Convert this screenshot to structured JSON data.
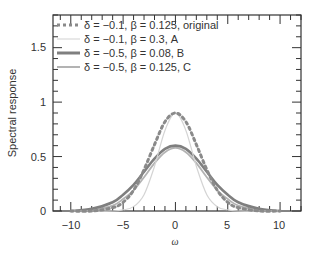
{
  "chart_data": {
    "type": "line",
    "title": "",
    "xlabel": "ω",
    "ylabel": "Spectral response",
    "xlim": [
      -11.7,
      12
    ],
    "ylim": [
      0,
      1.8
    ],
    "xticks": [
      -10,
      -5,
      0,
      5,
      10
    ],
    "xtick_labels": [
      "−10",
      "−5",
      "0",
      "5",
      "10"
    ],
    "yticks": [
      0,
      0.5,
      1,
      1.5
    ],
    "ytick_labels": [
      "0",
      "0.5",
      "1",
      "1.5"
    ],
    "grid": false,
    "legend_position": "upper left",
    "x": [
      -10,
      -8,
      -6,
      -5,
      -4,
      -3,
      -2,
      -1,
      0,
      1,
      2,
      3,
      4,
      5,
      6,
      8,
      10
    ],
    "series": [
      {
        "name": "δ = −0.1, β = 0.125, original",
        "style": "dotted",
        "color": "#8a8a8a",
        "values": [
          0.0,
          0.0,
          0.03,
          0.08,
          0.19,
          0.38,
          0.61,
          0.82,
          0.9,
          0.82,
          0.61,
          0.38,
          0.19,
          0.08,
          0.03,
          0.0,
          0.0
        ]
      },
      {
        "name": "δ = −0.1, β = 0.3, A",
        "style": "solid-thin",
        "color": "#d4d4d4",
        "values": [
          0.0,
          0.0,
          0.0,
          0.01,
          0.04,
          0.15,
          0.41,
          0.74,
          0.9,
          0.74,
          0.41,
          0.15,
          0.04,
          0.01,
          0.0,
          0.0,
          0.0
        ]
      },
      {
        "name": "δ = −0.5, β = 0.08, B",
        "style": "solid-thick",
        "color": "#7f7f7f",
        "values": [
          0.0,
          0.02,
          0.08,
          0.15,
          0.24,
          0.36,
          0.48,
          0.57,
          0.6,
          0.57,
          0.48,
          0.36,
          0.24,
          0.15,
          0.08,
          0.02,
          0.0
        ]
      },
      {
        "name": "δ = −0.5, β = 0.125, C",
        "style": "solid",
        "color": "#b3b3b3",
        "values": [
          0.0,
          0.01,
          0.05,
          0.11,
          0.19,
          0.31,
          0.44,
          0.54,
          0.58,
          0.54,
          0.44,
          0.31,
          0.19,
          0.11,
          0.05,
          0.01,
          0.0
        ]
      }
    ]
  },
  "legend": {
    "items": [
      {
        "label": "δ = −0.1, β = 0.125, original"
      },
      {
        "label": "δ = −0.1, β = 0.3, A"
      },
      {
        "label": "δ = −0.5, β = 0.08, B"
      },
      {
        "label": "δ = −0.5, β = 0.125, C"
      }
    ]
  },
  "axes": {
    "xlabel": "ω",
    "ylabel": "Spectral response",
    "yticks": [
      {
        "label": "1.5"
      },
      {
        "label": "1"
      },
      {
        "label": "0.5"
      },
      {
        "label": "0"
      }
    ],
    "xticks": [
      {
        "label": "−10"
      },
      {
        "label": "−5"
      },
      {
        "label": "0"
      },
      {
        "label": "5"
      },
      {
        "label": "10"
      }
    ]
  }
}
